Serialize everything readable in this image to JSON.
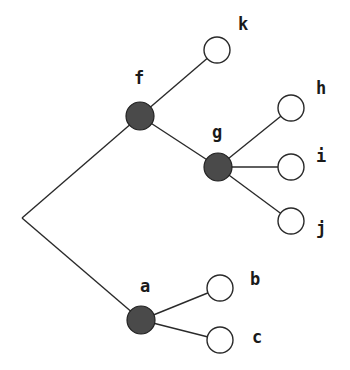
{
  "diagram": {
    "type": "tree",
    "root": {
      "x": 22,
      "y": 218
    },
    "colors": {
      "internal_node": "#4a4a4a",
      "leaf_node": "#ffffff",
      "edge": "#2a2a2a"
    },
    "nodes": [
      {
        "id": "f",
        "label": "f",
        "kind": "internal",
        "x": 140,
        "y": 116,
        "r": 14,
        "lx": 134,
        "ly": 84
      },
      {
        "id": "g",
        "label": "g",
        "kind": "internal",
        "x": 218,
        "y": 167,
        "r": 14,
        "lx": 212,
        "ly": 138
      },
      {
        "id": "a",
        "label": "a",
        "kind": "internal",
        "x": 141,
        "y": 320,
        "r": 14,
        "lx": 140,
        "ly": 292
      },
      {
        "id": "k",
        "label": "k",
        "kind": "leaf",
        "x": 217,
        "y": 50,
        "r": 13,
        "lx": 238,
        "ly": 30
      },
      {
        "id": "h",
        "label": "h",
        "kind": "leaf",
        "x": 291,
        "y": 108,
        "r": 13,
        "lx": 316,
        "ly": 94
      },
      {
        "id": "i",
        "label": "i",
        "kind": "leaf",
        "x": 291,
        "y": 167,
        "r": 13,
        "lx": 316,
        "ly": 162
      },
      {
        "id": "j",
        "label": "j",
        "kind": "leaf",
        "x": 291,
        "y": 221,
        "r": 13,
        "lx": 316,
        "ly": 234
      },
      {
        "id": "b",
        "label": "b",
        "kind": "leaf",
        "x": 220,
        "y": 288,
        "r": 13,
        "lx": 250,
        "ly": 285
      },
      {
        "id": "c",
        "label": "c",
        "kind": "leaf",
        "x": 220,
        "y": 340,
        "r": 13,
        "lx": 252,
        "ly": 343
      }
    ],
    "edges": [
      [
        "root",
        "f"
      ],
      [
        "root",
        "a"
      ],
      [
        "f",
        "k"
      ],
      [
        "f",
        "g"
      ],
      [
        "g",
        "h"
      ],
      [
        "g",
        "i"
      ],
      [
        "g",
        "j"
      ],
      [
        "a",
        "b"
      ],
      [
        "a",
        "c"
      ]
    ]
  }
}
